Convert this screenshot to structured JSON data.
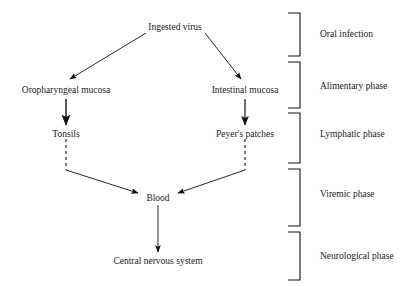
{
  "diagram": {
    "line_color": "#111111",
    "text_color": "#1a1a1a",
    "background": "#ffffff",
    "nodes": [
      {
        "id": "ingested-virus",
        "label": "Ingested virus",
        "x": 175,
        "y": 28
      },
      {
        "id": "oropharyngeal-mucosa",
        "label": "Oropharyngeal mucosa",
        "x": 66,
        "y": 91
      },
      {
        "id": "intestinal-mucosa",
        "label": "Intestinal mucosa",
        "x": 245,
        "y": 91
      },
      {
        "id": "tonsils",
        "label": "Tonsils",
        "x": 66,
        "y": 135
      },
      {
        "id": "peyers-patches",
        "label": "Peyer's patches",
        "x": 245,
        "y": 135
      },
      {
        "id": "blood",
        "label": "Blood",
        "x": 158,
        "y": 199
      },
      {
        "id": "central-nervous-system",
        "label": "Central nervous system",
        "x": 158,
        "y": 262
      }
    ],
    "edges": [
      {
        "id": "virus-to-oropharyngeal",
        "from": "ingested-virus",
        "to": "oropharyngeal-mucosa",
        "style": "solid",
        "arrow": true
      },
      {
        "id": "virus-to-intestinal",
        "from": "ingested-virus",
        "to": "intestinal-mucosa",
        "style": "solid",
        "arrow": true
      },
      {
        "id": "oropharyngeal-to-tonsils",
        "from": "oropharyngeal-mucosa",
        "to": "tonsils",
        "style": "solid",
        "arrow": true
      },
      {
        "id": "intestinal-to-peyers",
        "from": "intestinal-mucosa",
        "to": "peyers-patches",
        "style": "solid",
        "arrow": true
      },
      {
        "id": "tonsils-dashed-drop",
        "from": "tonsils",
        "to": "tonsils-junction",
        "style": "dashed",
        "arrow": false
      },
      {
        "id": "peyers-dashed-drop",
        "from": "peyers-patches",
        "to": "peyers-junction",
        "style": "dashed",
        "arrow": false
      },
      {
        "id": "tonsils-to-blood",
        "from": "tonsils-junction",
        "to": "blood",
        "style": "solid",
        "arrow": true
      },
      {
        "id": "peyers-to-blood",
        "from": "peyers-junction",
        "to": "blood",
        "style": "solid",
        "arrow": true
      },
      {
        "id": "blood-to-cns",
        "from": "blood",
        "to": "central-nervous-system",
        "style": "solid",
        "arrow": true
      }
    ],
    "phases": [
      {
        "id": "oral-infection",
        "label": "Oral infection",
        "bracket_top": 13,
        "bracket_bottom": 56,
        "label_y": 34
      },
      {
        "id": "alimentary-phase",
        "label": "Alimentary phase",
        "bracket_top": 62,
        "bracket_bottom": 108,
        "label_y": 86
      },
      {
        "id": "lymphatic-phase",
        "label": "Lymphatic phase",
        "bracket_top": 113,
        "bracket_bottom": 163,
        "label_y": 134
      },
      {
        "id": "viremic-phase",
        "label": "Viremic phase",
        "bracket_top": 169,
        "bracket_bottom": 226,
        "label_y": 194
      },
      {
        "id": "neurological-phase",
        "label": "Neurological phase",
        "bracket_top": 232,
        "bracket_bottom": 280,
        "label_y": 256
      }
    ],
    "bracket_x": 300,
    "bracket_arm": 12,
    "phase_label_x": 320
  }
}
